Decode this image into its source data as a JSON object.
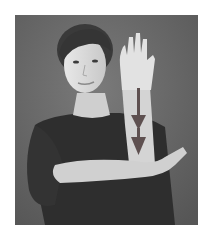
{
  "image": {
    "description": "Black-and-white photograph of a woman demonstrating a sign-language gesture: right hand raised vertically with palm facing out, left forearm held horizontally beneath it; two downward arrows drawn along the raised forearm.",
    "colors": {
      "page_background": "#ffffff",
      "photo_background": "#6b6b6b",
      "shirt": "#2e2e2e",
      "skin": "#d9d9d9",
      "hair": "#3a3a3a",
      "arrow": "#5e5050"
    },
    "annotations": [
      {
        "type": "arrow",
        "direction": "down",
        "label": "movement-arrow-1"
      },
      {
        "type": "arrow",
        "direction": "down",
        "label": "movement-arrow-2"
      }
    ]
  }
}
